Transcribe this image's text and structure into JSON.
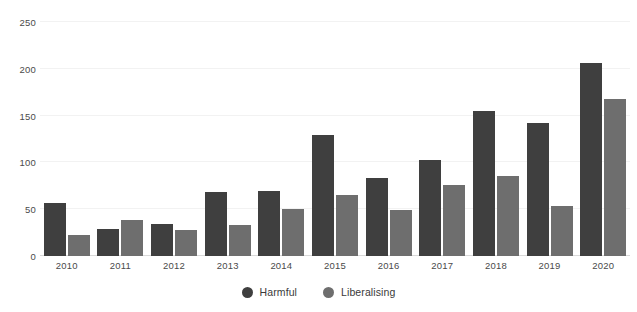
{
  "chart_data": {
    "type": "bar",
    "title": "",
    "subtitle": "",
    "xlabel": "",
    "ylabel": "",
    "categories": [
      "2010",
      "2011",
      "2012",
      "2013",
      "2014",
      "2015",
      "2016",
      "2017",
      "2018",
      "2019",
      "2020"
    ],
    "series": [
      {
        "name": "Harmful",
        "color": "#3f3f3f",
        "values": [
          57,
          29,
          34,
          68,
          69,
          129,
          83,
          103,
          155,
          142,
          206
        ]
      },
      {
        "name": "Liberalising",
        "color": "#6e6e6e",
        "values": [
          22,
          38,
          28,
          33,
          50,
          65,
          49,
          76,
          86,
          53,
          168
        ]
      }
    ],
    "ylim": [
      0,
      250
    ],
    "yticks": [
      0,
      50,
      100,
      150,
      200,
      250
    ],
    "ytick_labels": [
      "0",
      "50",
      "100",
      "150",
      "200",
      "250"
    ],
    "grid": true,
    "grid_axis": "y",
    "legend_position": "bottom",
    "bar_group_mode": "grouped"
  },
  "legend": {
    "items": [
      {
        "label": "Harmful",
        "color": "#3f3f3f",
        "icon": "circle-marker-icon"
      },
      {
        "label": "Liberalising",
        "color": "#6e6e6e",
        "icon": "circle-marker-icon"
      }
    ]
  },
  "colors": {
    "background": "#ffffff",
    "gridline": "#f2f2f2",
    "axis_line": "#d9d9d9",
    "tick_text": "#4a4a4a",
    "harmful": "#3f3f3f",
    "liberalising": "#6e6e6e"
  }
}
